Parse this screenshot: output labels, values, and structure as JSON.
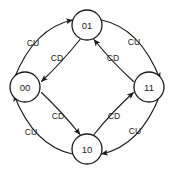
{
  "diagram": {
    "type": "state-transition-diagram",
    "title": "",
    "nodes": [
      {
        "id": "s01",
        "label": "01",
        "position": "top",
        "cx": 87,
        "cy": 25,
        "r": 15
      },
      {
        "id": "s00",
        "label": "00",
        "position": "left",
        "cx": 25,
        "cy": 87,
        "r": 15
      },
      {
        "id": "s11",
        "label": "11",
        "position": "right",
        "cx": 149,
        "cy": 87,
        "r": 15
      },
      {
        "id": "s10",
        "label": "10",
        "position": "bottom",
        "cx": 87,
        "cy": 149,
        "r": 15
      }
    ],
    "edges": [
      {
        "id": "e-00-01",
        "from": "00",
        "to": "01",
        "label": "CU",
        "ring": "outer",
        "label_x": 33,
        "label_y": 43
      },
      {
        "id": "e-01-11",
        "from": "01",
        "to": "11",
        "label": "CU",
        "ring": "outer",
        "label_x": 134,
        "label_y": 42
      },
      {
        "id": "e-11-10",
        "from": "11",
        "to": "10",
        "label": "CU",
        "ring": "outer",
        "label_x": 135,
        "label_y": 131
      },
      {
        "id": "e-10-00",
        "from": "10",
        "to": "00",
        "label": "CU",
        "ring": "outer",
        "label_x": 31,
        "label_y": 132
      },
      {
        "id": "e-01-00",
        "from": "01",
        "to": "00",
        "label": "CD",
        "ring": "inner",
        "label_x": 57,
        "label_y": 58
      },
      {
        "id": "e-11-01",
        "from": "11",
        "to": "01",
        "label": "CD",
        "ring": "inner",
        "label_x": 113,
        "label_y": 58
      },
      {
        "id": "e-10-11",
        "from": "10",
        "to": "11",
        "label": "CD",
        "ring": "inner",
        "label_x": 114,
        "label_y": 116
      },
      {
        "id": "e-00-10",
        "from": "00",
        "to": "10",
        "label": "CD",
        "ring": "inner",
        "label_x": 58,
        "label_y": 116
      }
    ],
    "legend": {
      "count_up": "CU",
      "count_down": "CD"
    },
    "colors": {
      "stroke": "#1b1b1b",
      "node_fill": "#ffffff",
      "background": "#ffffff",
      "text": "#1b1b1b"
    }
  }
}
